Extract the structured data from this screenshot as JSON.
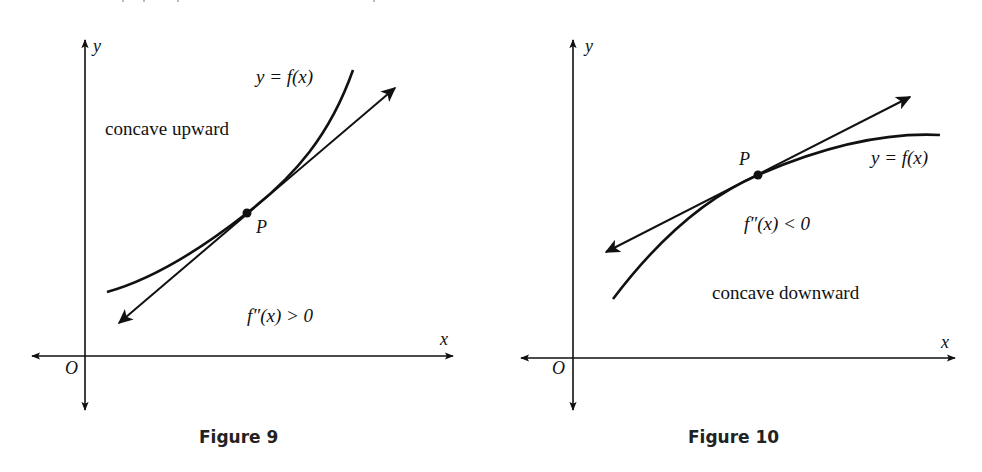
{
  "figures": [
    {
      "id": "figure-9",
      "caption": "Figure 9",
      "curve_label": "y = f(x)",
      "concavity_label": "concave upward",
      "condition_label": "f″(x) > 0",
      "point_label": "P",
      "axis_x_label": "x",
      "axis_y_label": "y",
      "origin_label": "O"
    },
    {
      "id": "figure-10",
      "caption": "Figure 10",
      "curve_label": "y = f(x)",
      "concavity_label": "concave downward",
      "condition_label": "f″(x) < 0",
      "point_label": "P",
      "axis_x_label": "x",
      "axis_y_label": "y",
      "origin_label": "O"
    }
  ],
  "colors": {
    "ink": "#111111",
    "background": "#ffffff"
  }
}
